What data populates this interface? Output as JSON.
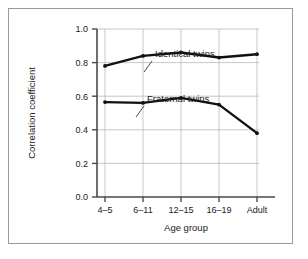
{
  "chart_data": {
    "type": "line",
    "title": "",
    "xlabel": "Age group",
    "ylabel": "Correlation coefficient",
    "categories": [
      "4–5",
      "6–11",
      "12–15",
      "16–19",
      "Adult"
    ],
    "ylim": [
      0.0,
      1.0
    ],
    "yticks": [
      "0.0",
      "0.2",
      "0.4",
      "0.6",
      "0.8",
      "1.0"
    ],
    "ytick_values": [
      0.0,
      0.2,
      0.4,
      0.6,
      0.8,
      1.0
    ],
    "grid": true,
    "legend_position": "inline-annotation",
    "series": [
      {
        "name": "Identical twins",
        "values": [
          0.78,
          0.84,
          0.86,
          0.83,
          0.85
        ],
        "color": "#111111"
      },
      {
        "name": "Fraternal twins",
        "values": [
          0.565,
          0.56,
          0.59,
          0.55,
          0.38
        ],
        "color": "#111111"
      }
    ],
    "annotations": [
      {
        "text": "Identical twins",
        "series": "Identical twins"
      },
      {
        "text": "Fraternal twins",
        "series": "Fraternal twins"
      }
    ]
  },
  "colors": {
    "line": "#111111",
    "grid": "#b9b9b9",
    "axis": "#4a4a4a",
    "border": "#9a9a9a",
    "background": "#ffffff",
    "text": "#1a1a1a"
  }
}
